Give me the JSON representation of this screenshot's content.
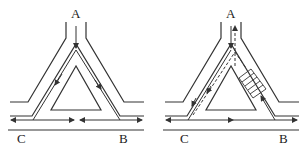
{
  "diagrams": [
    {
      "name": "left-diagram",
      "labels": {
        "top": "A",
        "bottom_left": "C",
        "bottom_right": "B"
      }
    },
    {
      "name": "right-diagram",
      "labels": {
        "top": "A",
        "bottom_left": "C",
        "bottom_right": "B"
      }
    }
  ],
  "colors": {
    "line": "#333333",
    "background": "#ffffff"
  }
}
